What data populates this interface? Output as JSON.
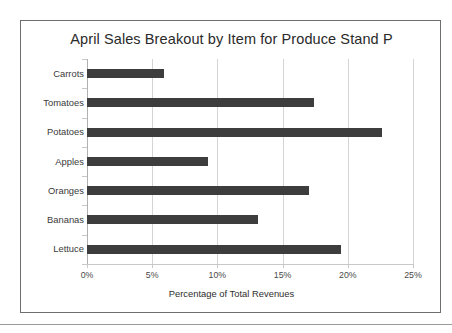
{
  "chart_data": {
    "type": "bar",
    "orientation": "horizontal",
    "title": "April Sales Breakout by Item for Produce Stand P",
    "xlabel": "Percentage of Total Revenues",
    "ylabel": "",
    "categories": [
      "Carrots",
      "Tomatoes",
      "Potatoes",
      "Apples",
      "Oranges",
      "Bananas",
      "Lettuce"
    ],
    "values": [
      5.9,
      17.4,
      22.6,
      9.3,
      17.0,
      13.1,
      19.5
    ],
    "xlim": [
      0,
      25
    ],
    "xticks": [
      0,
      5,
      10,
      15,
      20,
      25
    ],
    "xtick_labels": [
      "0%",
      "5%",
      "10%",
      "15%",
      "20%",
      "25%"
    ],
    "grid": true,
    "legend": false,
    "bar_color": "#3d3d3d",
    "background_color": "#ffffff",
    "frame_color": "#6e6e6e",
    "gridline_color": "#d4d4d4"
  }
}
